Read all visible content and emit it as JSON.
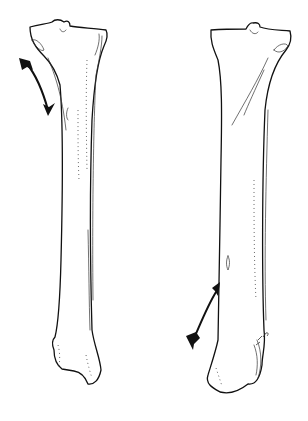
{
  "figure": {
    "views": [
      {
        "id": "left-view",
        "arrow_direction": "down"
      },
      {
        "id": "right-view",
        "arrow_direction": "up"
      }
    ],
    "colors": {
      "line": "#111111",
      "background": "#ffffff"
    }
  }
}
